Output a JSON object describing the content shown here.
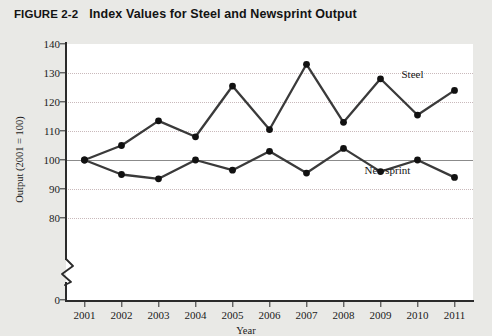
{
  "figure": {
    "label": "FIGURE 2-2",
    "title": "Index Values for Steel and Newsprint Output"
  },
  "chart_data": {
    "type": "line",
    "title": "Index Values for Steel and Newsprint Output",
    "xlabel": "Year",
    "ylabel": "Output (2001 = 100)",
    "categories": [
      "2001",
      "2002",
      "2003",
      "2004",
      "2005",
      "2006",
      "2007",
      "2008",
      "2009",
      "2010",
      "2011"
    ],
    "series": [
      {
        "name": "Steel",
        "values": [
          100,
          105,
          113.5,
          108,
          125.5,
          110.5,
          133,
          113,
          128,
          115.5,
          124
        ]
      },
      {
        "name": "Newsprint",
        "values": [
          100,
          95,
          93.5,
          100,
          96.5,
          103,
          95.5,
          104,
          96,
          100,
          94
        ]
      }
    ],
    "ylim": [
      80,
      140
    ],
    "y_ticks": [
      "0",
      "80",
      "90",
      "100",
      "110",
      "120",
      "130",
      "140"
    ],
    "y_tick_values": [
      0,
      80,
      90,
      100,
      110,
      120,
      130,
      140
    ],
    "axis_break": true,
    "axis_break_between": [
      0,
      80
    ],
    "grid": "horizontal-dotted",
    "reference_line": 100,
    "legend": "inline-annotations",
    "annotations": [
      {
        "text": "Steel",
        "year": "2010",
        "value": 124
      },
      {
        "text": "Newsprint",
        "year": "2009",
        "value": 91
      }
    ],
    "colors": {
      "line": "#3a3a3a",
      "marker": "#111111",
      "grid": "#c9b9bb",
      "axis": "#2b2b2b",
      "panel_background": "#ffffff",
      "page_background": "#e9e9e6"
    }
  }
}
